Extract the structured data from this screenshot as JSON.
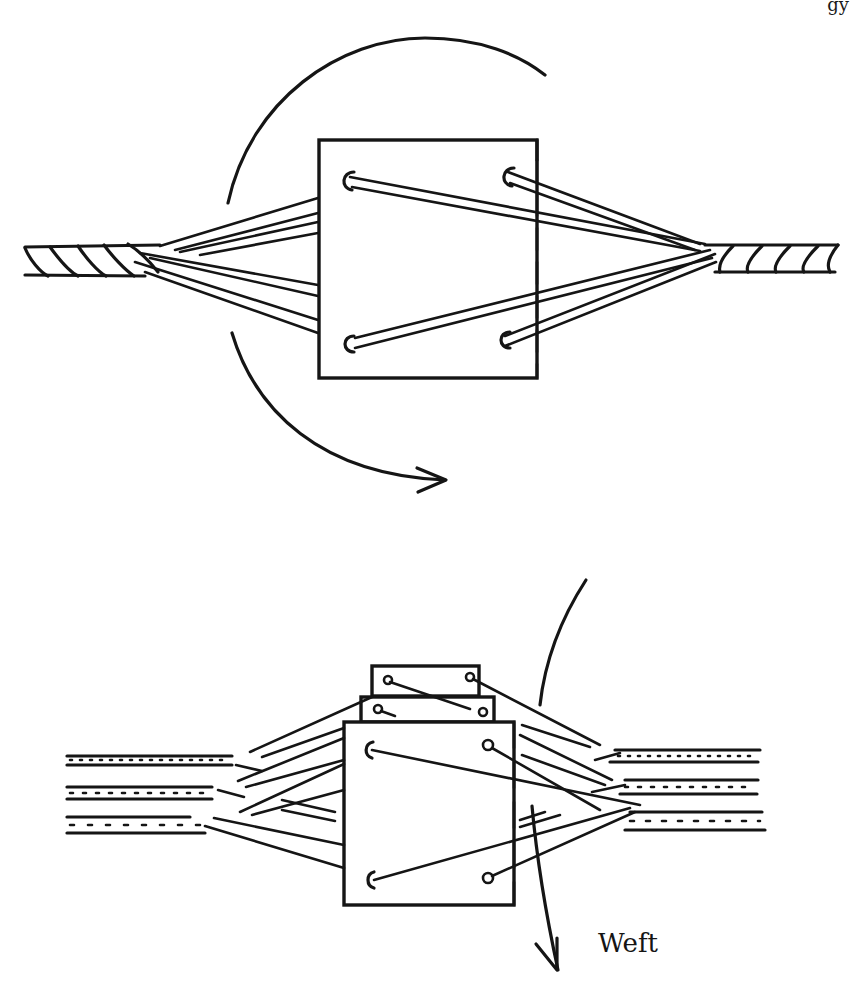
{
  "page": {
    "header_fragment": "gy"
  },
  "figure": {
    "top_panel": {
      "description": "Single square tablet with four holes, warp threads passing through holes converging to twisted cords on each side; curved arrow indicating rotation of the tablet",
      "holes": 4,
      "rotation_arrow": "clockwise"
    },
    "bottom_panel": {
      "description": "Pack of three stacked tablets with warp threads spreading from three twisted cords on each side; arc indicating turning; weft passing downward between sheds",
      "tablets": 3,
      "cords_left": 3,
      "cords_right": 3,
      "weft_label": "Weft"
    }
  }
}
